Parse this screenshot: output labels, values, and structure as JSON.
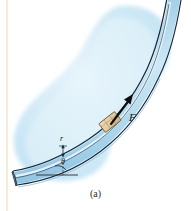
{
  "figure": {
    "caption": "(a)",
    "kind": "physics-diagram",
    "background_color": "#ffffff",
    "labels": {
      "force": "F",
      "radius": "r",
      "angle": "θ"
    },
    "colors": {
      "surface_blob": "#cfe8f5",
      "surface_blob_light": "#e4f2fa",
      "tube_fill": "#b9dcef",
      "tube_highlight": "#e8f5fc",
      "tube_outline": "#1b2f45",
      "block_fill": "#e3cda4",
      "block_outline": "#6b5a3c",
      "arrow": "#0d0d0d",
      "left_rule": "#f2ecd8",
      "leader_line": "#1b2f45",
      "dashed_line": "#2a2a2a"
    }
  },
  "elements": {
    "left_rule_name": "left-margin-rule",
    "blob_name": "surface-blob",
    "tube_name": "curved-tube",
    "block_name": "sliding-block",
    "arrow_name": "force-arrow",
    "radius_leader_name": "radius-leader-line",
    "angle_arc_name": "angle-arc",
    "baseline_name": "horizontal-reference-line"
  }
}
